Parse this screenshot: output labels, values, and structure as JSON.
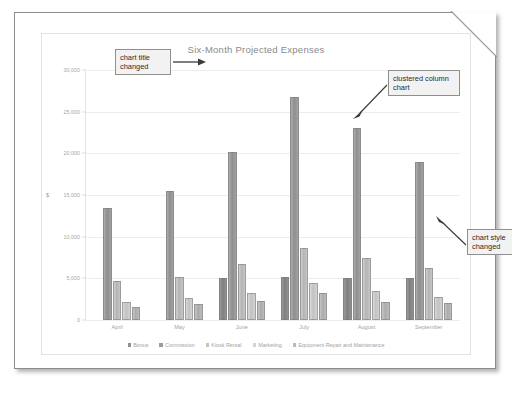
{
  "document": {
    "kind": "printed-page-with-folded-corner"
  },
  "chart_data": {
    "type": "bar",
    "title": "Six-Month Projected Expenses",
    "xlabel": "",
    "ylabel": "$",
    "categories": [
      "April",
      "May",
      "June",
      "July",
      "August",
      "September"
    ],
    "series": [
      {
        "name": "Bonus",
        "values": [
          0,
          0,
          5000,
          5200,
          5000,
          5000
        ],
        "color": "#8f8f8f"
      },
      {
        "name": "Commission",
        "values": [
          13500,
          15500,
          20200,
          26800,
          23000,
          19000
        ],
        "color": "#9b9b9b"
      },
      {
        "name": "Kiosk Rental",
        "values": [
          4700,
          5200,
          6700,
          8700,
          7500,
          6300
        ],
        "color": "#c4c4c4"
      },
      {
        "name": "Marketing",
        "values": [
          2200,
          2700,
          3200,
          4500,
          3500,
          2800
        ],
        "color": "#d4d4d4"
      },
      {
        "name": "Equipment Repair and Maintenance",
        "values": [
          1600,
          1900,
          2300,
          3300,
          2200,
          2100
        ],
        "color": "#bababa"
      }
    ],
    "ylim": [
      0,
      30000
    ],
    "yticks": [
      0,
      5000,
      10000,
      15000,
      20000,
      25000,
      30000
    ],
    "ytick_labels": [
      "0",
      "5,000",
      "10,000",
      "15,000",
      "20,000",
      "25,000",
      "30,000"
    ],
    "grid": true,
    "legend_position": "bottom"
  },
  "annotations": [
    {
      "id": "chart-title-changed",
      "line1": "chart title",
      "line2": "changed"
    },
    {
      "id": "clustered-column",
      "line1": "clustered column",
      "line2": "chart"
    },
    {
      "id": "chart-style-changed",
      "line1": "chart style",
      "line2": "changed"
    }
  ]
}
